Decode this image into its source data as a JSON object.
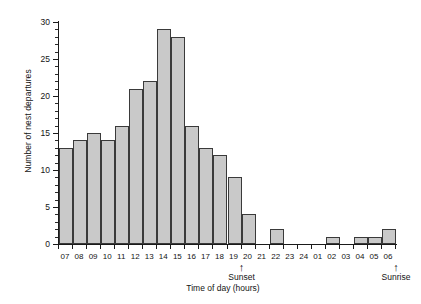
{
  "chart_data": {
    "type": "bar",
    "title": "",
    "xlabel": "Time of day (hours)",
    "ylabel": "Number of nest departures",
    "categories": [
      "07",
      "08",
      "09",
      "10",
      "11",
      "12",
      "13",
      "14",
      "15",
      "16",
      "17",
      "18",
      "19",
      "20",
      "21",
      "22",
      "23",
      "24",
      "01",
      "02",
      "03",
      "04",
      "05",
      "06"
    ],
    "values": [
      13,
      14,
      15,
      14,
      16,
      21,
      22,
      29,
      28,
      16,
      13,
      12,
      9,
      4,
      0,
      2,
      0,
      0,
      0,
      1,
      0,
      1,
      1,
      2
    ],
    "ylim": [
      0,
      30
    ],
    "yticks": [
      0,
      5,
      10,
      15,
      20,
      25,
      30
    ],
    "ytick_labels": [
      "0",
      "5",
      "10",
      "15",
      "20",
      "25",
      "30"
    ],
    "y_minor_tick_step": 1,
    "grid": false,
    "legend": null,
    "bar_fill_color": "#c9c9c9",
    "bar_edge_color": "#3a3a3a",
    "axis_color": "#1a1a1a",
    "background_color": "#ffffff",
    "annotations": [
      {
        "name": "sunset",
        "label": "Sunset",
        "arrow": "↑",
        "at_category": "19"
      },
      {
        "name": "sunrise",
        "label": "Sunrise",
        "arrow": "↑",
        "at_category": "06"
      }
    ]
  }
}
